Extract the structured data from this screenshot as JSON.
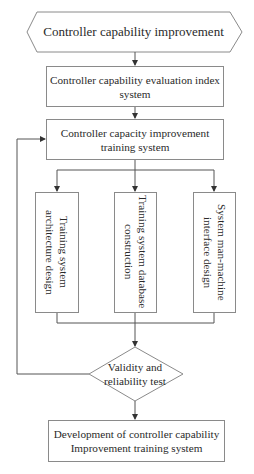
{
  "diagram": {
    "type": "flowchart",
    "start": {
      "label": "Controller capability  improvement",
      "shape": "hexagon"
    },
    "step1": {
      "label_line1": "Controller capability evaluation index",
      "label_line2": "system"
    },
    "step2": {
      "label_line1": "Controller capacity improvement",
      "label_line2": "training system"
    },
    "branches": [
      {
        "label_line1": "Training system",
        "label_line2": "architecture design"
      },
      {
        "label_line1": "Training system database",
        "label_line2": "construction"
      },
      {
        "label_line1": "System man-machine",
        "label_line2": "interface design"
      }
    ],
    "decision": {
      "label_line1": "Validity and",
      "label_line2": "reliability test",
      "shape": "diamond"
    },
    "end": {
      "label_line1": "Development of controller capability",
      "label_line2": "Improvement training system"
    },
    "feedback": {
      "from": "decision",
      "to": "step2"
    },
    "colors": {
      "stroke": "#8a8a8a",
      "text": "#2a2a2a",
      "background": "#ffffff"
    }
  }
}
